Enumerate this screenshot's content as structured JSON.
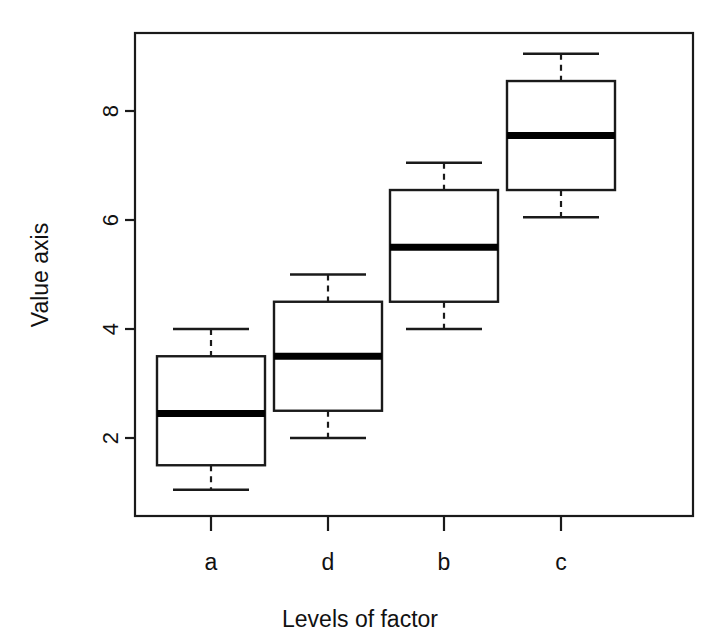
{
  "chart_data": {
    "type": "box",
    "title": "",
    "xlabel": "Levels of factor",
    "ylabel": "Value axis",
    "categories": [
      "a",
      "d",
      "b",
      "c"
    ],
    "ytick_labels": [
      "2",
      "4",
      "6",
      "8"
    ],
    "ytick_values": [
      2,
      4,
      6,
      8
    ],
    "ylim": [
      0.6,
      9.45
    ],
    "grid": false,
    "legend": null,
    "boxes": [
      {
        "category": "a",
        "whisker_low": 1.05,
        "q1": 1.5,
        "median": 2.45,
        "q3": 3.5,
        "whisker_high": 4.0
      },
      {
        "category": "d",
        "whisker_low": 2.0,
        "q1": 2.5,
        "median": 3.5,
        "q3": 4.5,
        "whisker_high": 5.0
      },
      {
        "category": "b",
        "whisker_low": 4.0,
        "q1": 4.5,
        "median": 5.5,
        "q3": 6.55,
        "whisker_high": 7.05
      },
      {
        "category": "c",
        "whisker_low": 6.05,
        "q1": 6.55,
        "median": 7.55,
        "q3": 8.55,
        "whisker_high": 9.05
      }
    ],
    "colors": {
      "line": "#1a1a1a",
      "median": "#000000",
      "box_fill": "#ffffff",
      "background": "#ffffff"
    }
  },
  "axes": {
    "ylabel_text": "Value axis",
    "xlabel_text": "Levels of factor",
    "ytick_0": "2",
    "ytick_1": "4",
    "ytick_2": "6",
    "ytick_3": "8",
    "xtick_0": "a",
    "xtick_1": "d",
    "xtick_2": "b",
    "xtick_3": "c"
  }
}
